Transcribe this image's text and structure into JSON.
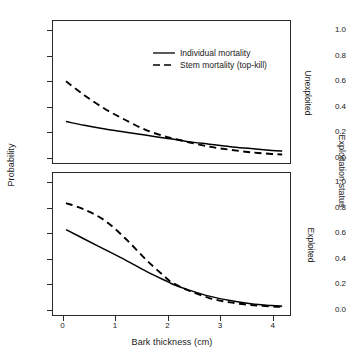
{
  "chart_data": {
    "type": "line",
    "title": "",
    "xlabel": "Bark thickness (cm)",
    "ylabel": "Probability",
    "xlim": [
      -0.2,
      4.35
    ],
    "ylim": [
      -0.05,
      1.08
    ],
    "xticks": [
      "0",
      "1",
      "2",
      "3",
      "4"
    ],
    "xtick_values": [
      0,
      1,
      2,
      3,
      4
    ],
    "yticks": [
      "0.0",
      "0.2",
      "0.4",
      "0.6",
      "0.8",
      "1.0"
    ],
    "ytick_values": [
      0.0,
      0.2,
      0.4,
      0.6,
      0.8,
      1.0
    ],
    "grid": false,
    "legend_position": "top-center-inside-upper-panel",
    "outer_strip_label": "Exploitation status",
    "panels": [
      {
        "strip_label": "Unexploited",
        "series": [
          {
            "name": "Individual mortality",
            "style": "solid",
            "color": "#000000",
            "x": [
              0.05,
              0.4,
              0.8,
              1.2,
              1.6,
              2.0,
              2.2,
              2.4,
              2.8,
              3.2,
              3.6,
              4.0,
              4.2
            ],
            "y": [
              0.28,
              0.25,
              0.22,
              0.195,
              0.17,
              0.145,
              0.135,
              0.12,
              0.1,
              0.08,
              0.065,
              0.05,
              0.045
            ]
          },
          {
            "name": "Stem mortality (top-kill)",
            "style": "dashed",
            "color": "#000000",
            "x": [
              0.05,
              0.4,
              0.8,
              1.2,
              1.6,
              2.0,
              2.2,
              2.4,
              2.8,
              3.2,
              3.6,
              4.0,
              4.2
            ],
            "y": [
              0.6,
              0.49,
              0.38,
              0.29,
              0.21,
              0.155,
              0.135,
              0.115,
              0.08,
              0.055,
              0.035,
              0.022,
              0.018
            ]
          }
        ]
      },
      {
        "strip_label": "Exploited",
        "series": [
          {
            "name": "Individual mortality",
            "style": "solid",
            "color": "#000000",
            "x": [
              0.05,
              0.4,
              0.8,
              1.2,
              1.6,
              2.0,
              2.1,
              2.4,
              2.8,
              3.2,
              3.6,
              4.0,
              4.2
            ],
            "y": [
              0.63,
              0.555,
              0.47,
              0.385,
              0.295,
              0.215,
              0.195,
              0.15,
              0.1,
              0.065,
              0.04,
              0.025,
              0.02
            ]
          },
          {
            "name": "Stem mortality (top-kill)",
            "style": "dashed",
            "color": "#000000",
            "x": [
              0.05,
              0.4,
              0.8,
              1.2,
              1.6,
              2.0,
              2.1,
              2.4,
              2.8,
              3.2,
              3.6,
              4.0,
              4.2
            ],
            "y": [
              0.84,
              0.79,
              0.7,
              0.555,
              0.385,
              0.235,
              0.205,
              0.145,
              0.085,
              0.05,
              0.03,
              0.018,
              0.014
            ]
          }
        ]
      }
    ],
    "legend": [
      {
        "label": "Individual mortality",
        "style": "solid",
        "color": "#000000"
      },
      {
        "label": "Stem mortality (top-kill)",
        "style": "dashed",
        "color": "#000000"
      }
    ]
  },
  "colors": {
    "line": "#000000",
    "frame": "#2b2b2b",
    "background": "#ffffff",
    "text": "#1a1a1a"
  }
}
